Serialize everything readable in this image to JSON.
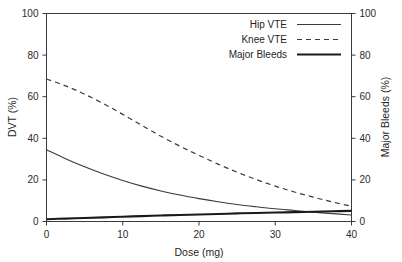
{
  "chart_data": {
    "type": "line",
    "title": "",
    "xlabel": "Dose (mg)",
    "ylabel": "DVT (%)",
    "y2label": "Major Bleeds (%)",
    "xlim": [
      0,
      40
    ],
    "ylim": [
      0,
      100
    ],
    "y2lim": [
      0,
      100
    ],
    "grid": false,
    "legend_position": "top-right",
    "xticks": [
      0,
      10,
      20,
      30,
      40
    ],
    "xtick_labels": [
      "0",
      "10",
      "20",
      "30",
      "40"
    ],
    "yticks": [
      0,
      20,
      40,
      60,
      80,
      100
    ],
    "ytick_labels": [
      "0",
      "20",
      "40",
      "60",
      "80",
      "100"
    ],
    "y2ticks": [
      0,
      20,
      40,
      60,
      80,
      100
    ],
    "y2tick_labels": [
      "0",
      "20",
      "40",
      "60",
      "80",
      "100"
    ],
    "x": [
      0,
      2.5,
      5,
      7.5,
      10,
      12.5,
      15,
      17.5,
      20,
      22.5,
      25,
      27.5,
      30,
      32.5,
      35,
      37.5,
      40
    ],
    "series": [
      {
        "name": "Hip VTE",
        "axis": "left",
        "style": "solid-thin",
        "color": "#3a3a3a",
        "values": [
          34.5,
          30.2,
          26.3,
          22.8,
          19.7,
          17.0,
          14.7,
          12.7,
          11.0,
          9.5,
          8.2,
          7.1,
          6.1,
          5.3,
          4.5,
          3.8,
          3.1
        ]
      },
      {
        "name": "Knee VTE",
        "axis": "left",
        "style": "dashed",
        "color": "#3a3a3a",
        "values": [
          68.5,
          65.2,
          61.2,
          56.6,
          51.5,
          46.2,
          41.0,
          36.2,
          31.8,
          27.6,
          23.7,
          20.2,
          17.0,
          14.2,
          11.7,
          9.4,
          7.3
        ]
      },
      {
        "name": "Major Bleeds",
        "axis": "right",
        "style": "solid-thick",
        "color": "#1a1a1a",
        "values": [
          1.1,
          1.4,
          1.7,
          2.0,
          2.3,
          2.6,
          2.9,
          3.1,
          3.4,
          3.6,
          3.9,
          4.1,
          4.3,
          4.5,
          4.7,
          4.9,
          5.1
        ]
      }
    ]
  },
  "legend": {
    "items": [
      {
        "label": "Hip VTE",
        "style": "solid-thin"
      },
      {
        "label": "Knee VTE",
        "style": "dashed"
      },
      {
        "label": "Major Bleeds",
        "style": "solid-thick"
      }
    ]
  },
  "colors": {
    "background": "#ffffff",
    "axis": "#3b3b3b",
    "text": "#1f1f1f",
    "series_thin": "#3a3a3a",
    "series_thick": "#1a1a1a"
  }
}
